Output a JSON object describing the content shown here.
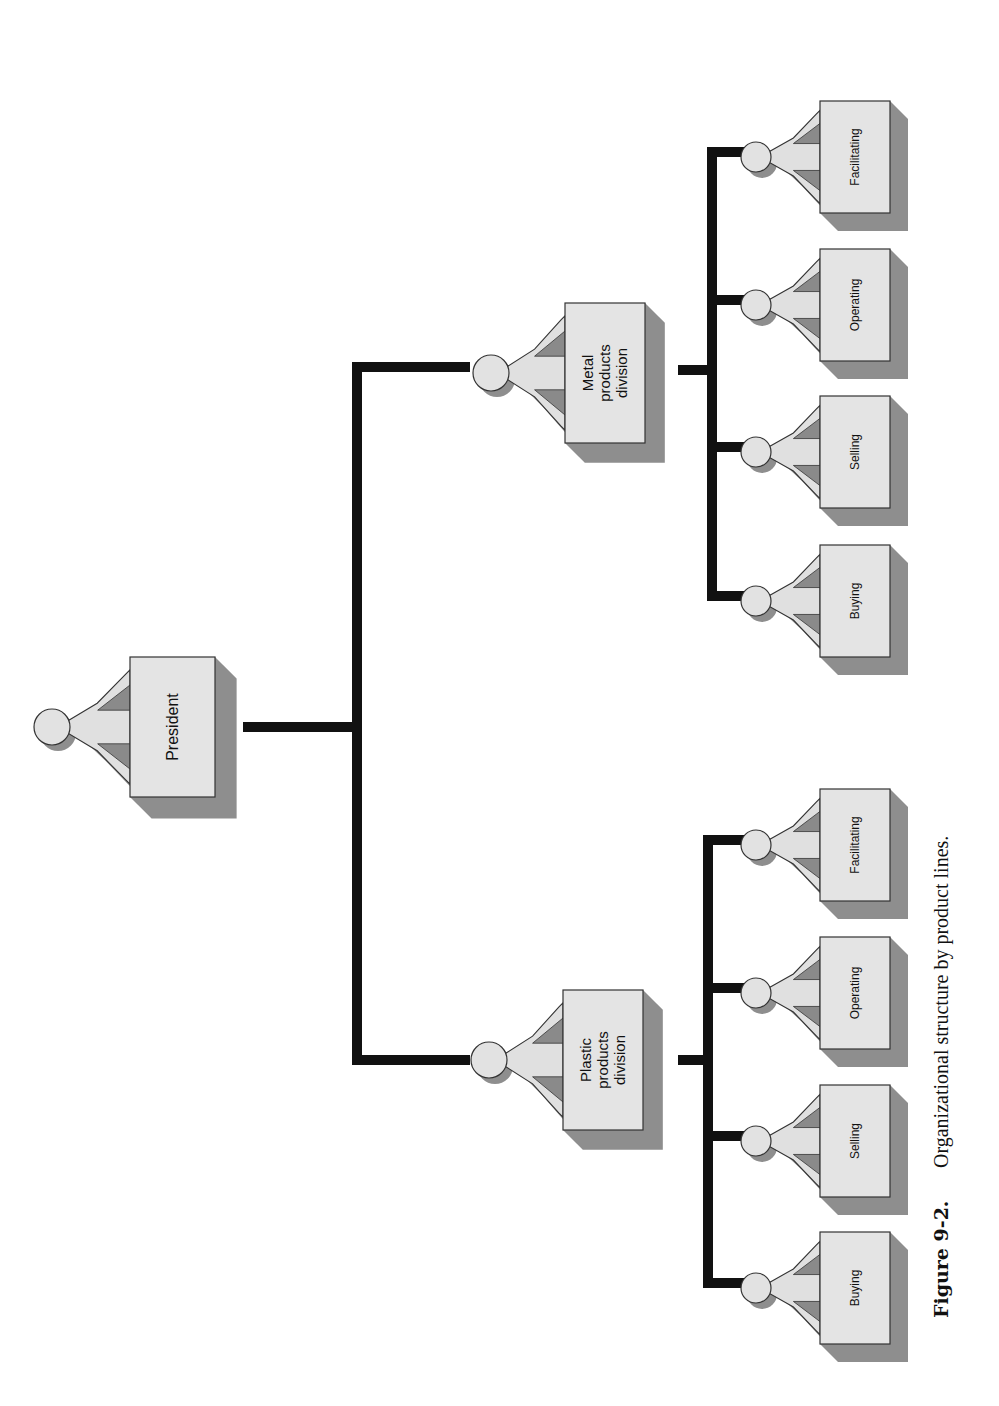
{
  "figure": {
    "caption_label": "Figure 9-2.",
    "caption_text": "Organizational structure by product lines."
  },
  "org_chart": {
    "root": {
      "id": "president",
      "label_lines": [
        "President"
      ],
      "children": [
        {
          "id": "metal-products-division",
          "label_lines": [
            "Metal",
            "products",
            "division"
          ],
          "children": [
            {
              "id": "metal-facilitating",
              "label_lines": [
                "Facilitating"
              ]
            },
            {
              "id": "metal-operating",
              "label_lines": [
                "Operating"
              ]
            },
            {
              "id": "metal-selling",
              "label_lines": [
                "Selling"
              ]
            },
            {
              "id": "metal-buying",
              "label_lines": [
                "Buying"
              ]
            }
          ]
        },
        {
          "id": "plastic-products-division",
          "label_lines": [
            "Plastic",
            "products",
            "division"
          ],
          "children": [
            {
              "id": "plastic-facilitating",
              "label_lines": [
                "Facilitating"
              ]
            },
            {
              "id": "plastic-operating",
              "label_lines": [
                "Operating"
              ]
            },
            {
              "id": "plastic-selling",
              "label_lines": [
                "Selling"
              ]
            },
            {
              "id": "plastic-buying",
              "label_lines": [
                "Buying"
              ]
            }
          ]
        }
      ]
    }
  },
  "colors": {
    "box_fill": "#e4e4e4",
    "shadow": "#8e8e8e",
    "connector": "#111111",
    "text": "#111111"
  }
}
